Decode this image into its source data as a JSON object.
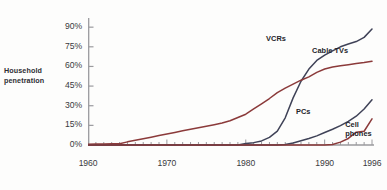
{
  "chart_data": {
    "type": "line",
    "title": "",
    "subtitle": "",
    "xlabel": "",
    "ylabel": "Household penetration",
    "ylabel_line1": "Household",
    "ylabel_line2": "penetration",
    "xlim": [
      1960,
      1996
    ],
    "ylim": [
      0,
      97
    ],
    "grid": false,
    "legend_position": "inline-annotations",
    "ytick_labels": [
      "0%",
      "15%",
      "30%",
      "45%",
      "60%",
      "75%",
      "90%"
    ],
    "ytick_values": [
      0,
      15,
      30,
      45,
      60,
      75,
      90
    ],
    "xtick_labels": [
      "1960",
      "1970",
      "1980",
      "1990",
      "1996"
    ],
    "xtick_values": [
      1960,
      1970,
      1980,
      1990,
      1996
    ],
    "minor_xtick_interval": 1,
    "series": [
      {
        "name": "VCRs",
        "color": "#3f4257",
        "label_x": 1985.1,
        "label_y": 80.0,
        "label_anchor": "end",
        "x": [
          1960,
          1961,
          1962,
          1963,
          1964,
          1965,
          1966,
          1967,
          1968,
          1969,
          1970,
          1971,
          1972,
          1973,
          1974,
          1975,
          1976,
          1977,
          1978,
          1979,
          1980,
          1981,
          1982,
          1983,
          1984,
          1985,
          1986,
          1987,
          1988,
          1989,
          1990,
          1991,
          1992,
          1993,
          1994,
          1995,
          1996
        ],
        "values": [
          0,
          0,
          0,
          0,
          0,
          0,
          0,
          0,
          0,
          0,
          0,
          0,
          0,
          0,
          0,
          0,
          0,
          0,
          0,
          0,
          1.1,
          1.8,
          3.1,
          5.8,
          10.6,
          20.8,
          36.0,
          48.7,
          58.0,
          64.6,
          68.6,
          71.9,
          75.0,
          77.1,
          79.0,
          82.2,
          88.6
        ]
      },
      {
        "name": "Cable TVs",
        "color": "#8b3a3a",
        "label_x": 1988.4,
        "label_y": 71.0,
        "label_anchor": "start",
        "x": [
          1960,
          1961,
          1962,
          1963,
          1964,
          1965,
          1966,
          1967,
          1968,
          1969,
          1970,
          1971,
          1972,
          1973,
          1974,
          1975,
          1976,
          1977,
          1978,
          1979,
          1980,
          1981,
          1982,
          1983,
          1984,
          1985,
          1986,
          1987,
          1988,
          1989,
          1990,
          1991,
          1992,
          1993,
          1994,
          1995,
          1996
        ],
        "values": [
          0.6,
          0.7,
          0.8,
          0.9,
          1.0,
          2.4,
          3.6,
          4.8,
          6.0,
          7.2,
          8.4,
          9.6,
          10.8,
          12.0,
          13.2,
          14.3,
          15.5,
          16.8,
          18.5,
          21.0,
          23.5,
          27.5,
          31.5,
          35.5,
          40.0,
          43.5,
          46.5,
          49.5,
          52.0,
          55.5,
          58.0,
          59.5,
          60.5,
          61.3,
          62.2,
          63.0,
          64.0
        ]
      },
      {
        "name": "PCs",
        "color": "#3f4257",
        "label_x": 1988.2,
        "label_y": 24.5,
        "label_anchor": "end",
        "x": [
          1960,
          1961,
          1962,
          1963,
          1964,
          1965,
          1966,
          1967,
          1968,
          1969,
          1970,
          1971,
          1972,
          1973,
          1974,
          1975,
          1976,
          1977,
          1978,
          1979,
          1980,
          1981,
          1982,
          1983,
          1984,
          1985,
          1986,
          1987,
          1988,
          1989,
          1990,
          1991,
          1992,
          1993,
          1994,
          1995,
          1996
        ],
        "values": [
          0,
          0,
          0,
          0,
          0,
          0,
          0,
          0,
          0,
          0,
          0,
          0,
          0,
          0,
          0,
          0,
          0,
          0,
          0,
          0,
          0,
          0,
          0,
          0,
          0,
          0.3,
          1.5,
          3.2,
          5.0,
          7.0,
          9.5,
          12.0,
          14.8,
          18.0,
          22.0,
          27.5,
          34.5
        ]
      },
      {
        "name": "Cell phones",
        "color": "#8b3a3a",
        "label_x": 1992.6,
        "label_y": 14.5,
        "label_anchor": "start",
        "label_line1": "Cell",
        "label_line2": "phones",
        "x": [
          1960,
          1961,
          1962,
          1963,
          1964,
          1965,
          1966,
          1967,
          1968,
          1969,
          1970,
          1971,
          1972,
          1973,
          1974,
          1975,
          1976,
          1977,
          1978,
          1979,
          1980,
          1981,
          1982,
          1983,
          1984,
          1985,
          1986,
          1987,
          1988,
          1989,
          1990,
          1991,
          1992,
          1993,
          1994,
          1995,
          1996
        ],
        "values": [
          0,
          0,
          0,
          0,
          0,
          0,
          0,
          0,
          0,
          0,
          0,
          0,
          0,
          0,
          0,
          0,
          0,
          0,
          0,
          0,
          0,
          0,
          0,
          0,
          0,
          0,
          0,
          0,
          0,
          0,
          0,
          0.4,
          2.2,
          5.0,
          9.8,
          10.5,
          20.0
        ]
      }
    ]
  },
  "axes": {
    "spine_color": "#9a9a9e",
    "tick_color": "#9a9a9e"
  },
  "caption": ""
}
